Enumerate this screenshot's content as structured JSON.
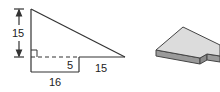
{
  "figure_2d": {
    "description": "Composite figure: right triangle atop a rectangle",
    "labels": {
      "height": "15",
      "rect_height": "5",
      "triangle_extension": "15",
      "rect_width": "16"
    },
    "right_angle_marker": true
  },
  "figure_3d": {
    "description": "Prism with the composite figure as its base"
  },
  "colors": {
    "line": "#333333",
    "face_top": "#dcdcdc",
    "face_side": "#9a9a9a"
  }
}
